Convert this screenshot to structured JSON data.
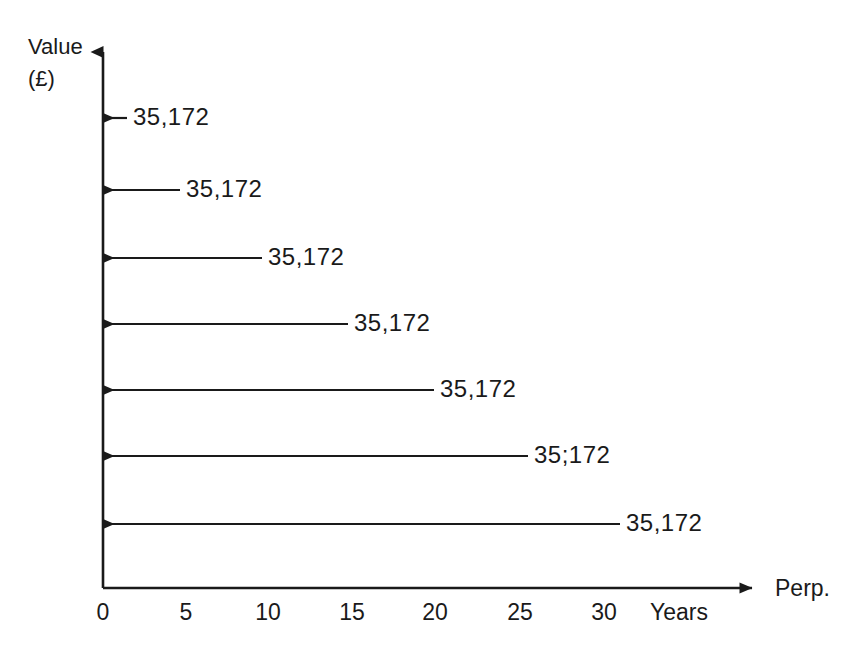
{
  "figure": {
    "background_color": "#ffffff",
    "ink_color": "#1a1a1a"
  },
  "axes": {
    "y_axis_title_line1": "Value",
    "y_axis_title_line2": "(£)",
    "x_axis_unit_label": "Years",
    "x_axis_end_label": "Perp.",
    "origin_label": "0"
  },
  "chart_data": {
    "type": "line",
    "title": "",
    "subtitle": "",
    "xlabel": "Years",
    "ylabel": "Value (£)",
    "xlim": [
      0,
      40
    ],
    "ylim": [
      0,
      8
    ],
    "grid": false,
    "legend_position": "none",
    "x_tick_labels": [
      "0",
      "5",
      "10",
      "15",
      "20",
      "25",
      "30"
    ],
    "x_tick_values": [
      0,
      5,
      10,
      15,
      20,
      25,
      30
    ],
    "x_axis_extra_labels": [
      "Years",
      "Perp."
    ],
    "y_tick_labels": [],
    "annotation_note": "Seven leftward arrows denote equal cash flows of 35,172 discounted back to time 0; axis continues to perpetuity.",
    "series": [
      {
        "name": "Discounted cash flows",
        "marker": "left-arrow",
        "values": [
          35172,
          35172,
          35172,
          35172,
          35172,
          35172,
          35172
        ],
        "value_labels": [
          "35,172",
          "35,172",
          "35,172",
          "35,172",
          "35,172",
          "35;172",
          "35,172"
        ]
      }
    ],
    "arrows": [
      {
        "label": "35,172",
        "row": 1,
        "y": 118,
        "tail_x": 127,
        "head_x": 103,
        "label_x": 133
      },
      {
        "label": "35,172",
        "row": 2,
        "y": 190,
        "tail_x": 180,
        "head_x": 103,
        "label_x": 186
      },
      {
        "label": "35,172",
        "row": 3,
        "y": 258,
        "tail_x": 262,
        "head_x": 103,
        "label_x": 268
      },
      {
        "label": "35,172",
        "row": 4,
        "y": 324,
        "tail_x": 348,
        "head_x": 103,
        "label_x": 354
      },
      {
        "label": "35,172",
        "row": 5,
        "y": 390,
        "tail_x": 434,
        "head_x": 103,
        "label_x": 440
      },
      {
        "label": "35;172",
        "row": 6,
        "y": 456,
        "tail_x": 528,
        "head_x": 103,
        "label_x": 534
      },
      {
        "label": "35,172",
        "row": 7,
        "y": 524,
        "tail_x": 620,
        "head_x": 103,
        "label_x": 626
      }
    ],
    "x_ticks": [
      {
        "label": "0",
        "x": 103
      },
      {
        "label": "5",
        "x": 186
      },
      {
        "label": "10",
        "x": 268
      },
      {
        "label": "15",
        "x": 352
      },
      {
        "label": "20",
        "x": 435
      },
      {
        "label": "25",
        "x": 520
      },
      {
        "label": "30",
        "x": 604
      }
    ]
  }
}
